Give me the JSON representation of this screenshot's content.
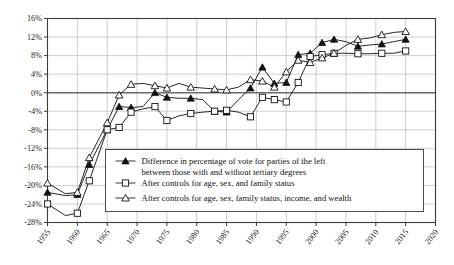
{
  "chart_data": {
    "type": "line",
    "title": "",
    "subtitle": "",
    "xlabel": "",
    "ylabel": "",
    "xlim": [
      1955,
      2020
    ],
    "ylim": [
      -28,
      16
    ],
    "grid": true,
    "legend_position": "inside-bottom-right",
    "x_ticks": [
      "1955",
      "1960",
      "1965",
      "1970",
      "1975",
      "1980",
      "1985",
      "1990",
      "1995",
      "2000",
      "2005",
      "2010",
      "2015",
      "2020"
    ],
    "y_ticks": [
      "16%",
      "12%",
      "8%",
      "4%",
      "0%",
      "-4%",
      "-8%",
      "-12%",
      "-16%",
      "-20%",
      "-24%",
      "-28%"
    ],
    "x": [
      1955,
      1958,
      1960,
      1962,
      1965,
      1967,
      1969,
      1971,
      1973,
      1975,
      1977,
      1979,
      1981,
      1983,
      1985,
      1987,
      1989,
      1991,
      1993,
      1995,
      1997,
      1999,
      2001,
      2003,
      2005,
      2007,
      2009,
      2011,
      2013,
      2015
    ],
    "series": [
      {
        "name": "Difference in percentage of vote for parties of the left between those with and without tertiary degrees",
        "marker": "filled-triangle",
        "values": [
          -21.5,
          -22.2,
          -22.0,
          -15.5,
          -8.0,
          -3.0,
          -3.2,
          -3.0,
          0.0,
          -1.0,
          -1.2,
          -1.2,
          -1.5,
          -4.0,
          -4.2,
          -1.5,
          1.0,
          5.5,
          2.0,
          2.2,
          8.2,
          8.5,
          10.8,
          11.5,
          11.0,
          10.0,
          10.3,
          10.5,
          11.0,
          11.5
        ]
      },
      {
        "name": "After controls for age, sex, and family status",
        "marker": "open-square",
        "values": [
          -24.0,
          -26.5,
          -26.0,
          -19.0,
          -8.0,
          -7.5,
          -4.2,
          -3.5,
          -3.0,
          -6.0,
          -5.0,
          -4.5,
          -4.2,
          -4.0,
          -3.8,
          -4.2,
          -5.2,
          -1.0,
          -1.5,
          -2.0,
          2.2,
          7.8,
          8.2,
          8.5,
          8.5,
          8.4,
          8.4,
          8.5,
          8.5,
          9.0
        ]
      },
      {
        "name": "After controls for age, sex, family status, income, and wealth",
        "marker": "open-triangle",
        "values": [
          -19.5,
          -21.8,
          -21.5,
          -14.0,
          -6.5,
          -0.5,
          1.8,
          2.0,
          1.5,
          1.0,
          2.0,
          1.2,
          1.0,
          0.8,
          0.6,
          1.2,
          2.8,
          2.5,
          1.2,
          4.5,
          7.0,
          6.5,
          7.5,
          8.5,
          10.2,
          11.5,
          11.8,
          12.5,
          13.0,
          13.2
        ]
      }
    ]
  },
  "legend": {
    "entries": [
      {
        "marker": "filled-triangle",
        "line1": "Difference in percentage of vote for parties of the left",
        "line2": "between those with and without tertiary degrees"
      },
      {
        "marker": "open-square",
        "line1": "After controls for age, sex, and family status",
        "line2": ""
      },
      {
        "marker": "open-triangle",
        "line1": "After controls for age, sex, family status, income, and wealth",
        "line2": ""
      }
    ]
  },
  "colors": {
    "ink": "#121212",
    "grid": "#b9b9b9",
    "zero": "#6a6a6a",
    "frame": "#3a3a3a",
    "background": "#ffffff"
  }
}
